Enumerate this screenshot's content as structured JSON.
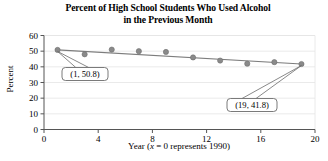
{
  "chart_data": {
    "type": "scatter",
    "title": "Percent of High School Students Who Used Alcohol in the Previous Month",
    "title_line_1": "Percent of High School Students Who Used Alcohol",
    "title_line_2": "in the Previous Month",
    "xlabel": "Year (x = 0 represents 1990)",
    "xlabel_prefix": "Year (",
    "xlabel_var": "x",
    "xlabel_suffix": " = 0 represents 1990)",
    "ylabel": "Percent",
    "x": [
      1,
      3,
      5,
      7,
      9,
      11,
      13,
      15,
      17,
      19
    ],
    "values": [
      50.8,
      48.0,
      51.0,
      50.0,
      49.5,
      46.0,
      44.0,
      42.0,
      43.0,
      41.8
    ],
    "series": [
      {
        "name": "Percent of high school students who used alcohol in the previous month",
        "values": [
          50.8,
          48.0,
          51.0,
          50.0,
          49.5,
          46.0,
          44.0,
          42.0,
          43.0,
          41.8
        ]
      }
    ],
    "trend_line": {
      "type": "linear-fit",
      "x_start": 1,
      "y_start": 50.8,
      "x_end": 19,
      "y_end": 41.8
    },
    "xlim": [
      0,
      20
    ],
    "ylim": [
      0,
      60
    ],
    "xticks": [
      0,
      4,
      8,
      12,
      16,
      20
    ],
    "yticks": [
      0,
      10,
      20,
      30,
      40,
      50,
      60
    ],
    "xtick_labels": [
      "0",
      "4",
      "8",
      "12",
      "16",
      "20"
    ],
    "ytick_labels": [
      "0",
      "10",
      "20",
      "30",
      "40",
      "50",
      "60"
    ],
    "grid": "horizontal",
    "legend": "none",
    "annotations": [
      {
        "label": "(1, 50.8)",
        "point_x": 1,
        "point_y": 50.8,
        "position": "below-left"
      },
      {
        "label": "(19, 41.8)",
        "point_x": 19,
        "point_y": 41.8,
        "position": "below-left"
      }
    ],
    "colors": {
      "marker": "#8a8a8a",
      "marker_edge": "#6e6e6e",
      "trend_line": "#7d7d7d",
      "axis": "#555555",
      "grid": "#e4e4e4",
      "callout_border": "#6b6b6b",
      "text": "#000000",
      "background": "#ffffff"
    }
  }
}
